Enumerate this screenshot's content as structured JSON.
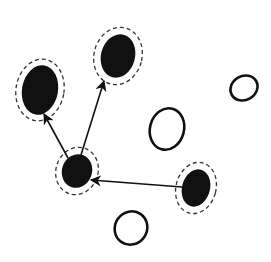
{
  "diagram": {
    "type": "node-graph",
    "colors": {
      "filled": "#111111",
      "stroke": "#111111",
      "halo": "#333333",
      "background": "#ffffff"
    },
    "nodes": [
      {
        "id": "A",
        "kind": "filled",
        "cx": 40,
        "cy": 90,
        "rx": 18,
        "ry": 25,
        "rot": 10,
        "halo": {
          "rx": 24,
          "ry": 31
        }
      },
      {
        "id": "B",
        "kind": "filled",
        "cx": 118,
        "cy": 56,
        "rx": 17,
        "ry": 22,
        "rot": 15,
        "halo": {
          "rx": 24,
          "ry": 29
        }
      },
      {
        "id": "C",
        "kind": "filled",
        "cx": 77,
        "cy": 171,
        "rx": 15,
        "ry": 17,
        "rot": 20,
        "halo": {
          "rx": 21,
          "ry": 24
        }
      },
      {
        "id": "D",
        "kind": "filled",
        "cx": 196,
        "cy": 188,
        "rx": 14,
        "ry": 19,
        "rot": 15,
        "halo": {
          "rx": 20,
          "ry": 26
        }
      },
      {
        "id": "E",
        "kind": "open",
        "cx": 167,
        "cy": 129,
        "rx": 17,
        "ry": 21,
        "rot": 15
      },
      {
        "id": "F",
        "kind": "open",
        "cx": 244,
        "cy": 88,
        "rx": 14,
        "ry": 12,
        "rot": -30
      },
      {
        "id": "G",
        "kind": "open",
        "cx": 131,
        "cy": 228,
        "rx": 16,
        "ry": 17,
        "rot": 35
      }
    ],
    "edges": [
      {
        "from": "C",
        "to": "A",
        "x1": 68,
        "y1": 158,
        "x2": 44,
        "y2": 114
      },
      {
        "from": "C",
        "to": "B",
        "x1": 81,
        "y1": 155,
        "x2": 104,
        "y2": 81
      },
      {
        "from": "D",
        "to": "C",
        "x1": 182,
        "y1": 187,
        "x2": 91,
        "y2": 180
      }
    ]
  }
}
